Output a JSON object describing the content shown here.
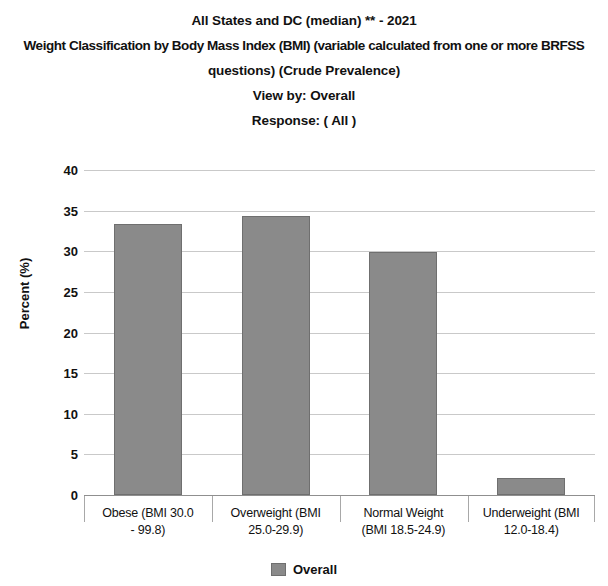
{
  "titles": {
    "line1": "All States and DC (median) ** - 2021",
    "line2": "Weight Classification by Body Mass Index (BMI) (variable calculated from one or more BRFSS",
    "line3": "questions) (Crude Prevalence)",
    "line4": "View by: Overall",
    "line5": "Response: ( All )"
  },
  "legend": {
    "label": "Overall",
    "color": "#8a8a8a"
  },
  "chart_data": {
    "type": "bar",
    "title": "All States and DC (median) ** - 2021 Weight Classification by Body Mass Index (BMI) (variable calculated from one or more BRFSS questions) (Crude Prevalence)",
    "subtitle": "View by: Overall / Response: ( All )",
    "categories": [
      "Obese (BMI 30.0 - 99.8)",
      "Overweight (BMI 25.0-29.9)",
      "Normal Weight (BMI 18.5-24.9)",
      "Underweight (BMI 12.0-18.4)"
    ],
    "category_lines": [
      [
        "Obese (BMI 30.0",
        "- 99.8)"
      ],
      [
        "Overweight (BMI",
        "25.0-29.9)"
      ],
      [
        "Normal Weight",
        "(BMI 18.5-24.9)"
      ],
      [
        "Underweight (BMI",
        "12.0-18.4)"
      ]
    ],
    "series": [
      {
        "name": "Overall",
        "color": "#8a8a8a",
        "values": [
          33.4,
          34.4,
          29.9,
          2.1
        ]
      }
    ],
    "values": [
      33.4,
      34.4,
      29.9,
      2.1
    ],
    "xlabel": "",
    "ylabel": "Percent (%)",
    "ylim": [
      0,
      40
    ],
    "yticks": [
      0,
      5,
      10,
      15,
      20,
      25,
      30,
      35,
      40
    ],
    "ytick_labels": [
      "0",
      "5",
      "10",
      "15",
      "20",
      "25",
      "30",
      "35",
      "40"
    ],
    "grid": true,
    "legend_position": "bottom"
  }
}
